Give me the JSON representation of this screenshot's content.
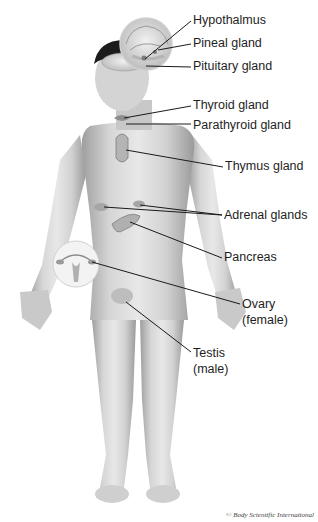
{
  "diagram": {
    "labels": [
      {
        "id": "hypothalmus",
        "text": "Hypothalmus",
        "x": 193,
        "y": 13
      },
      {
        "id": "pineal",
        "text": "Pineal gland",
        "x": 193,
        "y": 36
      },
      {
        "id": "pituitary",
        "text": "Pituitary gland",
        "x": 193,
        "y": 59
      },
      {
        "id": "thyroid",
        "text": "Thyroid gland",
        "x": 193,
        "y": 98
      },
      {
        "id": "parathyroid",
        "text": "Parathyroid gland",
        "x": 193,
        "y": 118
      },
      {
        "id": "thymus",
        "text": "Thymus gland",
        "x": 225,
        "y": 159
      },
      {
        "id": "adrenal",
        "text": "Adrenal glands",
        "x": 224,
        "y": 208
      },
      {
        "id": "pancreas",
        "text": "Pancreas",
        "x": 224,
        "y": 250
      },
      {
        "id": "ovary",
        "text": "Ovary",
        "x": 242,
        "y": 297
      },
      {
        "id": "ovary_note",
        "text": "(female)",
        "x": 242,
        "y": 313
      },
      {
        "id": "testis",
        "text": "Testis",
        "x": 193,
        "y": 346
      },
      {
        "id": "testis_note",
        "text": "(male)",
        "x": 193,
        "y": 362
      }
    ],
    "credit": "© Body Scientific International",
    "colors": {
      "line": "#1a1a1a",
      "text": "#1e1e1e",
      "skin": "#d9d9d9",
      "skin_shadow": "#a8a8a8",
      "hair": "#1c1c1c",
      "inset": "#f3f3f3"
    }
  }
}
